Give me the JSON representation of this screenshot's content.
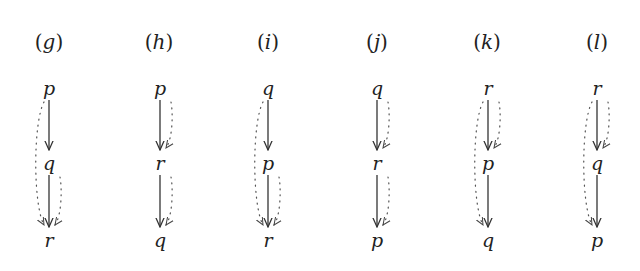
{
  "figure": {
    "panels": [
      {
        "id": "g",
        "label": "g",
        "nodes": [
          "p",
          "q",
          "r"
        ],
        "solid_edges": [
          [
            "p",
            "q"
          ],
          [
            "q",
            "r"
          ]
        ],
        "dotted_edges": [
          {
            "from": "p",
            "to": "r",
            "side": "left"
          },
          {
            "from": "q",
            "to": "r",
            "side": "right"
          }
        ]
      },
      {
        "id": "h",
        "label": "h",
        "nodes": [
          "p",
          "r",
          "q"
        ],
        "solid_edges": [
          [
            "p",
            "r"
          ],
          [
            "r",
            "q"
          ]
        ],
        "dotted_edges": [
          {
            "from": "p",
            "to": "r",
            "side": "right"
          },
          {
            "from": "r",
            "to": "q",
            "side": "right"
          }
        ]
      },
      {
        "id": "i",
        "label": "i",
        "nodes": [
          "q",
          "p",
          "r"
        ],
        "solid_edges": [
          [
            "q",
            "p"
          ],
          [
            "p",
            "r"
          ]
        ],
        "dotted_edges": [
          {
            "from": "q",
            "to": "r",
            "side": "left"
          },
          {
            "from": "p",
            "to": "r",
            "side": "right"
          }
        ]
      },
      {
        "id": "j",
        "label": "j",
        "nodes": [
          "q",
          "r",
          "p"
        ],
        "solid_edges": [
          [
            "q",
            "r"
          ],
          [
            "r",
            "p"
          ]
        ],
        "dotted_edges": [
          {
            "from": "q",
            "to": "r",
            "side": "right"
          },
          {
            "from": "r",
            "to": "p",
            "side": "right"
          }
        ]
      },
      {
        "id": "k",
        "label": "k",
        "nodes": [
          "r",
          "p",
          "q"
        ],
        "solid_edges": [
          [
            "r",
            "p"
          ],
          [
            "p",
            "q"
          ]
        ],
        "dotted_edges": [
          {
            "from": "r",
            "to": "p",
            "side": "right"
          },
          {
            "from": "r",
            "to": "q",
            "side": "left"
          }
        ]
      },
      {
        "id": "l",
        "label": "l",
        "nodes": [
          "r",
          "q",
          "p"
        ],
        "solid_edges": [
          [
            "r",
            "q"
          ],
          [
            "q",
            "p"
          ]
        ],
        "dotted_edges": [
          {
            "from": "r",
            "to": "q",
            "side": "right"
          },
          {
            "from": "r",
            "to": "p",
            "side": "left"
          }
        ]
      }
    ],
    "colors": {
      "stroke": "#333333",
      "text": "#222222",
      "background": "#ffffff"
    }
  }
}
